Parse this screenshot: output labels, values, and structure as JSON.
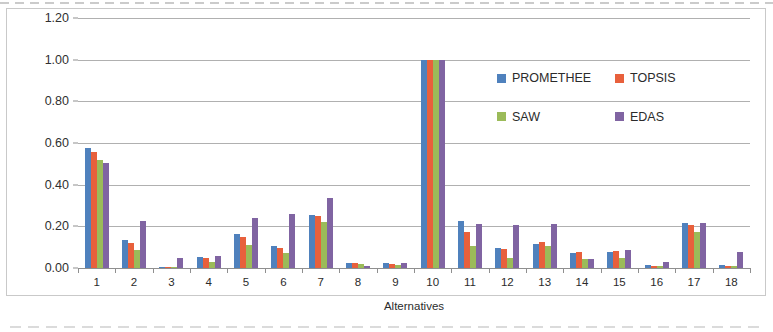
{
  "chart_data": {
    "type": "bar",
    "title": "",
    "xlabel": "Alternatives",
    "ylabel": "Aggregate criteria (normalised)",
    "categories": [
      "1",
      "2",
      "3",
      "4",
      "5",
      "6",
      "7",
      "8",
      "9",
      "10",
      "11",
      "12",
      "13",
      "14",
      "15",
      "16",
      "17",
      "18"
    ],
    "ylim": [
      0.0,
      1.2
    ],
    "y_ticks": [
      "0.00",
      "0.20",
      "0.40",
      "0.60",
      "0.80",
      "1.00",
      "1.20"
    ],
    "y_tick_values": [
      0.0,
      0.2,
      0.4,
      0.6,
      0.8,
      1.0,
      1.2
    ],
    "grid": true,
    "legend_position": "inside-upper-right",
    "series": [
      {
        "name": "PROMETHEE",
        "color": "#4f81bd",
        "values": [
          0.575,
          0.135,
          0.005,
          0.055,
          0.165,
          0.105,
          0.255,
          0.025,
          0.025,
          1.0,
          0.225,
          0.095,
          0.115,
          0.07,
          0.075,
          0.015,
          0.215,
          0.015
        ]
      },
      {
        "name": "TOPSIS",
        "color": "#e8603c",
        "values": [
          0.555,
          0.12,
          0.005,
          0.05,
          0.15,
          0.095,
          0.25,
          0.022,
          0.02,
          1.0,
          0.175,
          0.09,
          0.125,
          0.075,
          0.08,
          0.012,
          0.205,
          0.012
        ]
      },
      {
        "name": "SAW",
        "color": "#9bbb59",
        "values": [
          0.52,
          0.085,
          0.003,
          0.03,
          0.11,
          0.07,
          0.22,
          0.018,
          0.015,
          1.0,
          0.105,
          0.05,
          0.105,
          0.045,
          0.05,
          0.008,
          0.175,
          0.01
        ]
      },
      {
        "name": "EDAS",
        "color": "#8064a2",
        "values": [
          0.505,
          0.225,
          0.05,
          0.06,
          0.24,
          0.26,
          0.335,
          0.01,
          0.022,
          1.0,
          0.21,
          0.205,
          0.21,
          0.045,
          0.085,
          0.03,
          0.215,
          0.075
        ]
      }
    ]
  }
}
